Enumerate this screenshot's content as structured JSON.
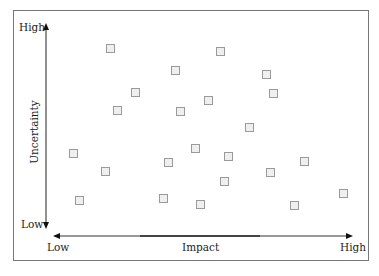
{
  "chart_data": {
    "type": "scatter",
    "title": "",
    "xlabel": "Impact",
    "ylabel": "Uncertainty",
    "x_tick_labels": {
      "low": "Low",
      "high": "High"
    },
    "y_tick_labels": {
      "low": "Low",
      "high": "High"
    },
    "xlim": [
      0,
      100
    ],
    "ylim": [
      0,
      100
    ],
    "grid": false,
    "marker": "square",
    "note": "Points are unlabeled; values estimated as % of axis range (Impact 0=Low..100=High, Uncertainty 0=Low..100=High).",
    "points": [
      {
        "x": 20,
        "y": 87
      },
      {
        "x": 56,
        "y": 86
      },
      {
        "x": 41,
        "y": 77
      },
      {
        "x": 71,
        "y": 75
      },
      {
        "x": 27,
        "y": 67
      },
      {
        "x": 74,
        "y": 66
      },
      {
        "x": 52,
        "y": 63
      },
      {
        "x": 22,
        "y": 58
      },
      {
        "x": 43,
        "y": 58
      },
      {
        "x": 66,
        "y": 51
      },
      {
        "x": 6,
        "y": 38
      },
      {
        "x": 48,
        "y": 40
      },
      {
        "x": 39,
        "y": 34
      },
      {
        "x": 58,
        "y": 36
      },
      {
        "x": 84,
        "y": 34
      },
      {
        "x": 17,
        "y": 29
      },
      {
        "x": 72,
        "y": 28
      },
      {
        "x": 57,
        "y": 24
      },
      {
        "x": 97,
        "y": 18
      },
      {
        "x": 9,
        "y": 15
      },
      {
        "x": 37,
        "y": 16
      },
      {
        "x": 50,
        "y": 13
      },
      {
        "x": 80,
        "y": 13
      }
    ]
  },
  "labels": {
    "y_high": "High",
    "y_low": "Low",
    "y_axis": "Uncertainty",
    "x_low": "Low",
    "x_high": "High",
    "x_axis": "Impact"
  },
  "pixel_points": [
    [
      110,
      48
    ],
    [
      220,
      51
    ],
    [
      175,
      70
    ],
    [
      266,
      74
    ],
    [
      135,
      92
    ],
    [
      273,
      93
    ],
    [
      208,
      100
    ],
    [
      117,
      110
    ],
    [
      180,
      111
    ],
    [
      249,
      127
    ],
    [
      73,
      153
    ],
    [
      195,
      148
    ],
    [
      168,
      162
    ],
    [
      228,
      156
    ],
    [
      304,
      161
    ],
    [
      105,
      171
    ],
    [
      270,
      172
    ],
    [
      224,
      181
    ],
    [
      343,
      193
    ],
    [
      79,
      200
    ],
    [
      163,
      198
    ],
    [
      200,
      204
    ],
    [
      294,
      205
    ]
  ]
}
